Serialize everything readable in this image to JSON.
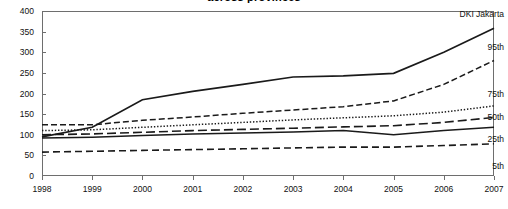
{
  "chart_data": {
    "type": "line",
    "title": "across provinces",
    "xlabel": "",
    "ylabel": "",
    "x": [
      1998,
      1999,
      2000,
      2001,
      2002,
      2003,
      2004,
      2005,
      2006,
      2007
    ],
    "xtick_labels": [
      "1998",
      "1999",
      "2000",
      "2001",
      "2002",
      "2003",
      "2004",
      "2005",
      "2006",
      "2007"
    ],
    "ytick_labels": [
      "0",
      "50",
      "100",
      "150",
      "200",
      "250",
      "300",
      "350",
      "400"
    ],
    "ytick_values": [
      0,
      50,
      100,
      150,
      200,
      250,
      300,
      350,
      400
    ],
    "ylim": [
      0,
      400
    ],
    "xlim": [
      1998,
      2007
    ],
    "grid": false,
    "legend_position": "right-inline-end-labels",
    "series": [
      {
        "name": "DKI Jakarta",
        "label": "DKI Jakarta",
        "style": "solid-thick",
        "color": "#1a1a1a",
        "values": [
          95,
          118,
          185,
          205,
          222,
          240,
          243,
          249,
          300,
          358
        ]
      },
      {
        "name": "95th",
        "label": "95th",
        "style": "dashed",
        "color": "#1a1a1a",
        "values": [
          124,
          124,
          135,
          143,
          152,
          160,
          168,
          182,
          222,
          280
        ]
      },
      {
        "name": "75th",
        "label": "75th",
        "style": "dotted",
        "color": "#1a1a1a",
        "values": [
          110,
          112,
          118,
          124,
          130,
          136,
          141,
          146,
          155,
          170
        ]
      },
      {
        "name": "50th",
        "label": "50th",
        "style": "long-dash",
        "color": "#1a1a1a",
        "values": [
          100,
          102,
          106,
          110,
          113,
          116,
          119,
          122,
          130,
          142
        ]
      },
      {
        "name": "25th",
        "label": "25th",
        "style": "solid",
        "color": "#1a1a1a",
        "values": [
          92,
          94,
          98,
          102,
          104,
          107,
          110,
          100,
          110,
          118
        ]
      },
      {
        "name": "5th",
        "label": "5th",
        "style": "medium-dash",
        "color": "#1a1a1a",
        "values": [
          58,
          60,
          62,
          64,
          66,
          68,
          70,
          70,
          74,
          78
        ]
      }
    ]
  }
}
